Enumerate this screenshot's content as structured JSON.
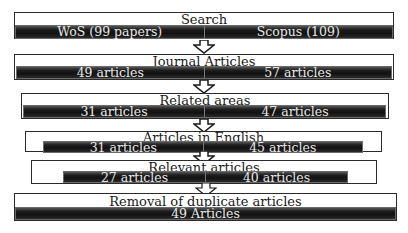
{
  "diagram": {
    "type": "flowchart",
    "direction": "top-to-bottom",
    "stages": [
      {
        "title": "Search",
        "left": "WoS (99 papers)",
        "right": "Scopus (109)"
      },
      {
        "title": "Journal Articles",
        "left": "49 articles",
        "right": "57 articles"
      },
      {
        "title": "Related areas",
        "left": "31 articles",
        "right": "47 articles"
      },
      {
        "title": "Articles in English",
        "left": "31 articles",
        "right": "45 articles"
      },
      {
        "title": "Relevant articles",
        "left": "27 articles",
        "right": "40 articles"
      },
      {
        "title": "Removal of duplicate articles",
        "result": "49 Articles"
      }
    ]
  },
  "colors": {
    "box_border": "#2a2a2a",
    "bar_fill": "#1a1a1a",
    "bar_text": "#e8e8e8",
    "title_text": "#1a1a1a",
    "background": "#ffffff"
  }
}
